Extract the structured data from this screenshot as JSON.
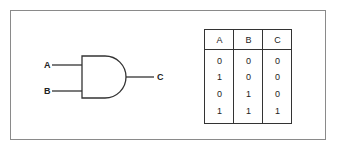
{
  "diagram": {
    "type": "logic-gate",
    "gate": "AND",
    "inputs": [
      "A",
      "B"
    ],
    "output": "C",
    "labels": {
      "input_a": "A",
      "input_b": "B",
      "output_c": "C"
    }
  },
  "truth_table": {
    "headers": [
      "A",
      "B",
      "C"
    ],
    "rows": [
      [
        "0",
        "0",
        "0"
      ],
      [
        "1",
        "0",
        "0"
      ],
      [
        "0",
        "1",
        "0"
      ],
      [
        "1",
        "1",
        "1"
      ]
    ]
  },
  "colors": {
    "line": "#333333",
    "frame": "#8a8a8a",
    "text": "#222222"
  }
}
